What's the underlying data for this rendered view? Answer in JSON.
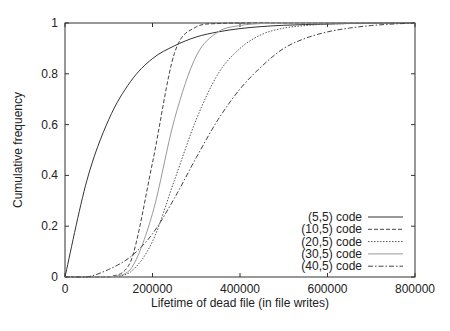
{
  "chart_data": {
    "type": "line",
    "title": "",
    "xlabel": "Lifetime of dead file (in file writes)",
    "ylabel": "Cumulative frequency",
    "xlim": [
      0,
      800000
    ],
    "ylim": [
      0,
      1
    ],
    "xticks": [
      0,
      200000,
      400000,
      600000,
      800000
    ],
    "xtick_labels": [
      "0",
      "200000",
      "400000",
      "600000",
      "800000"
    ],
    "yticks": [
      0,
      0.2,
      0.4,
      0.6,
      0.8,
      1
    ],
    "ytick_labels": [
      "0",
      "0.2",
      "0.4",
      "0.6",
      "0.8",
      "1"
    ],
    "grid": false,
    "legend_position": "lower right",
    "x": [
      0,
      50000,
      100000,
      150000,
      200000,
      250000,
      300000,
      350000,
      400000,
      450000,
      500000,
      550000,
      600000,
      650000,
      700000,
      750000,
      800000
    ],
    "series": [
      {
        "name": "(5,5) code",
        "style": "solid",
        "color": "#333333",
        "values": [
          0,
          0.38,
          0.62,
          0.77,
          0.86,
          0.91,
          0.945,
          0.965,
          0.978,
          0.986,
          0.991,
          0.994,
          0.996,
          0.998,
          0.999,
          1.0,
          1.0
        ]
      },
      {
        "name": "(10,5) code",
        "style": "dashed",
        "color": "#444444",
        "values": [
          0,
          0,
          0.0,
          0.06,
          0.45,
          0.88,
          0.985,
          0.998,
          1.0,
          1.0,
          1.0,
          1.0,
          1.0,
          1.0,
          1.0,
          1.0,
          1.0
        ]
      },
      {
        "name": "(20,5) code",
        "style": "dotted",
        "color": "#555555",
        "values": [
          0,
          0,
          0.0,
          0.02,
          0.14,
          0.38,
          0.62,
          0.8,
          0.9,
          0.955,
          0.98,
          0.99,
          0.996,
          0.998,
          1.0,
          1.0,
          1.0
        ]
      },
      {
        "name": "(30,5) code",
        "style": "solid-light",
        "color": "#999999",
        "values": [
          0,
          0,
          0.0,
          0.03,
          0.25,
          0.62,
          0.87,
          0.965,
          0.99,
          0.998,
          1.0,
          1.0,
          1.0,
          1.0,
          1.0,
          1.0,
          1.0
        ]
      },
      {
        "name": "(40,5) code",
        "style": "dash-dot",
        "color": "#444444",
        "values": [
          0,
          0.0,
          0.03,
          0.08,
          0.17,
          0.31,
          0.47,
          0.62,
          0.74,
          0.83,
          0.9,
          0.94,
          0.965,
          0.98,
          0.99,
          0.996,
          1.0
        ]
      }
    ]
  }
}
